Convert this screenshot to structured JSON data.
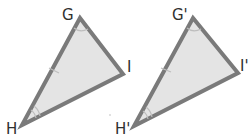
{
  "figure": {
    "cropped_top_text": "•• •• •••",
    "colors": {
      "stroke": "#7a7a7a",
      "fill": "#e4e4e4",
      "label": "#2f2f2f",
      "marks": "#bdbdbd"
    },
    "triangles": [
      {
        "name": "GHI",
        "vertices": [
          {
            "label": "G",
            "x": 80,
            "y": 18
          },
          {
            "label": "I",
            "x": 123,
            "y": 74
          },
          {
            "label": "H",
            "x": 22,
            "y": 125
          }
        ],
        "marks": {
          "side_GH_ticks": 1,
          "angle_G_arcs": 1,
          "angle_H_arcs": 2
        }
      },
      {
        "name": "G'H'I'",
        "vertices": [
          {
            "label": "G'",
            "x": 193,
            "y": 18
          },
          {
            "label": "I'",
            "x": 238,
            "y": 73
          },
          {
            "label": "H'",
            "x": 134,
            "y": 126
          }
        ],
        "marks": {
          "side_GH_ticks": 1,
          "angle_G_arcs": 1,
          "angle_H_arcs": 2
        }
      }
    ]
  }
}
